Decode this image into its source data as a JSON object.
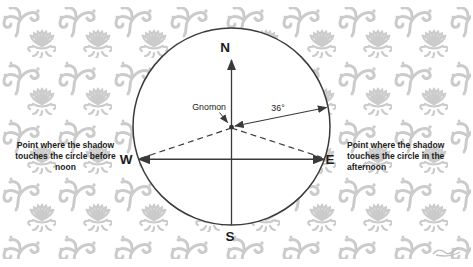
{
  "figure": {
    "compass": {
      "north": "N",
      "south": "S",
      "west": "W",
      "east": "E"
    },
    "gnomon_label": "Gnomon",
    "angle_label": "36°",
    "annotations": {
      "before_noon": "Point where the shadow touches the circle before noon",
      "afternoon": "Point where the shadow touches the circle in the afternoon"
    }
  },
  "colors": {
    "line": "#3a3a3a",
    "text": "#1c1c1c",
    "pattern_motif": "#cbcbcb",
    "circle_fill": "#ffffff",
    "background": "#ffffff"
  }
}
